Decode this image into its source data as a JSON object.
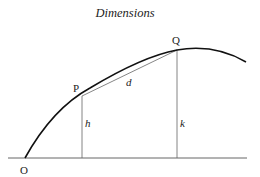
{
  "title": "Dimensions",
  "points": {
    "O": "O",
    "P": "P",
    "Q": "Q"
  },
  "segments": {
    "chord": "d",
    "height_p": "h",
    "height_q": "k"
  },
  "colors": {
    "curve": "#111111",
    "lines": "#555555",
    "text": "#222222"
  }
}
